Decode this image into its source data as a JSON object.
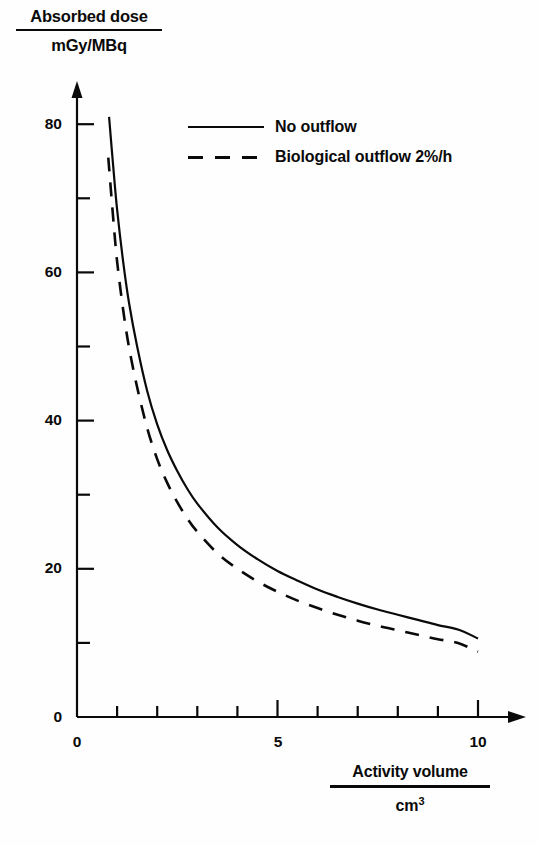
{
  "chart_data": {
    "type": "line",
    "title": "",
    "ylabel_numerator": "Absorbed dose",
    "ylabel_denominator": "mGy/MBq",
    "xlabel_numerator": "Activity volume",
    "xlabel_denominator": "cm",
    "xlabel_denominator_exponent": "3",
    "xlim": [
      0,
      10.8
    ],
    "ylim": [
      0,
      86
    ],
    "grid": false,
    "legend_position": "top-right-inside",
    "x_major_ticks": [
      0,
      5,
      10
    ],
    "x_major_tick_labels": [
      "0",
      "5",
      "10"
    ],
    "x_minor_ticks": [
      1,
      2,
      3,
      4,
      6,
      7,
      8,
      9
    ],
    "y_major_ticks": [
      0,
      20,
      40,
      60,
      80
    ],
    "y_major_tick_labels": [
      "0",
      "20",
      "40",
      "60",
      "80"
    ],
    "y_minor_ticks": [
      10,
      30,
      50,
      70
    ],
    "axis_arrows": true,
    "series": [
      {
        "name": "No outflow",
        "style": "solid",
        "color": "#0a0a0a",
        "x": [
          0.8,
          0.9,
          1.0,
          1.15,
          1.3,
          1.5,
          1.75,
          2.0,
          2.25,
          2.5,
          2.75,
          3.0,
          3.5,
          4.0,
          4.5,
          5.0,
          5.5,
          6.0,
          6.5,
          7.0,
          7.5,
          8.0,
          8.5,
          9.0,
          9.5,
          10.0
        ],
        "y": [
          81.0,
          74.5,
          68.5,
          61.5,
          55.8,
          50.0,
          44.0,
          39.5,
          36.0,
          33.2,
          30.8,
          28.8,
          25.6,
          23.2,
          21.3,
          19.7,
          18.4,
          17.2,
          16.2,
          15.3,
          14.5,
          13.8,
          13.1,
          12.4,
          11.8,
          10.6
        ]
      },
      {
        "name": "Biological outflow 2%/h",
        "style": "dashed",
        "color": "#0a0a0a",
        "x": [
          0.78,
          0.9,
          1.0,
          1.15,
          1.3,
          1.5,
          1.75,
          2.0,
          2.25,
          2.5,
          2.75,
          3.0,
          3.5,
          4.0,
          4.5,
          5.0,
          5.5,
          6.0,
          6.5,
          7.0,
          7.5,
          8.0,
          8.5,
          9.0,
          9.5,
          10.0
        ],
        "y": [
          75.5,
          67.5,
          61.5,
          55.0,
          49.8,
          44.5,
          39.0,
          34.8,
          31.6,
          29.0,
          26.8,
          25.0,
          22.1,
          20.0,
          18.3,
          16.9,
          15.7,
          14.7,
          13.8,
          13.0,
          12.3,
          11.7,
          11.1,
          10.5,
          10.0,
          8.8
        ]
      }
    ]
  },
  "legend": {
    "entries": [
      {
        "label": "No outflow",
        "style": "solid"
      },
      {
        "label": "Biological outflow 2%/h",
        "style": "dashed"
      }
    ]
  },
  "caption": ""
}
